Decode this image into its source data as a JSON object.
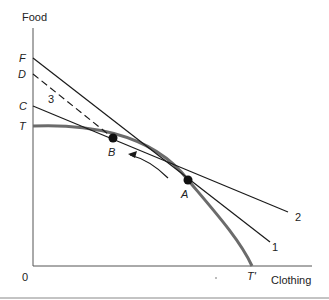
{
  "diagram": {
    "axes": {
      "y_label": "Food",
      "x_label": "Clothing",
      "origin_label": "0"
    },
    "y_intercepts": [
      {
        "id": "F",
        "label": "F"
      },
      {
        "id": "D",
        "label": "D"
      },
      {
        "id": "C",
        "label": "C"
      },
      {
        "id": "T",
        "label": "T"
      }
    ],
    "x_intercepts": [
      {
        "id": "T_prime",
        "label": "T'"
      }
    ],
    "points": [
      {
        "id": "A",
        "label": "A"
      },
      {
        "id": "B",
        "label": "B"
      }
    ],
    "lines": [
      {
        "id": "1",
        "label": "1",
        "style": "solid",
        "from": "F",
        "tangent_at": "A"
      },
      {
        "id": "2",
        "label": "2",
        "style": "solid",
        "from": "C",
        "tangent_at": "B"
      },
      {
        "id": "3",
        "label": "3",
        "style": "dashed",
        "from": "D",
        "through": "B"
      }
    ],
    "curve": {
      "name": "production possibility frontier",
      "from": "T",
      "to": "T'"
    },
    "arrow": {
      "direction": "from A toward B"
    },
    "colors": {
      "curve": "#6b6b6b",
      "lines": "#1a1a1a",
      "axes": "#555555"
    }
  }
}
